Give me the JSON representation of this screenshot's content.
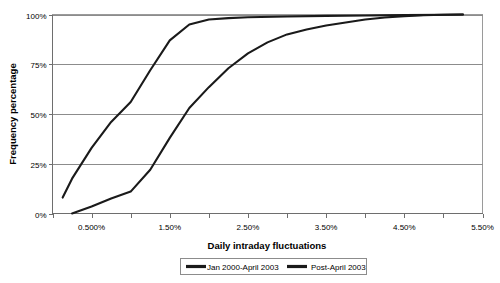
{
  "chart_data": {
    "type": "line",
    "title": "",
    "xlabel": "Daily intraday fluctuations",
    "ylabel": "Frequency percentage",
    "xlim": [
      0.0,
      5.5
    ],
    "ylim": [
      0,
      100
    ],
    "grid": true,
    "legend_position": "bottom",
    "x_tick_labels": [
      "0.500%",
      "1.50%",
      "2.50%",
      "3.50%",
      "4.50%",
      "5.50%"
    ],
    "x_tick_values": [
      0.5,
      1.5,
      2.5,
      3.5,
      4.5,
      5.5
    ],
    "x_minor_tick_values": [
      0.0,
      0.5,
      1.0,
      1.5,
      2.0,
      2.5,
      3.0,
      3.5,
      4.0,
      4.5,
      5.0,
      5.5
    ],
    "y_tick_labels": [
      "0%",
      "25%",
      "50%",
      "75%",
      "100%"
    ],
    "y_tick_values": [
      0,
      25,
      50,
      75,
      100
    ],
    "series": [
      {
        "name": "Jan 2000-April 2003",
        "color": "#1a1a1a",
        "x": [
          0.25,
          0.5,
          0.75,
          1.0,
          1.25,
          1.5,
          1.75,
          2.0,
          2.25,
          2.5,
          2.75,
          3.0,
          3.25,
          3.5,
          3.75,
          4.0,
          4.25,
          4.5,
          4.75,
          5.0,
          5.25
        ],
        "y": [
          0.0,
          3.5,
          7.5,
          11.0,
          22.0,
          38.0,
          53.0,
          63.5,
          73.0,
          80.5,
          86.0,
          90.0,
          92.5,
          94.5,
          96.0,
          97.5,
          98.5,
          99.2,
          99.6,
          99.9,
          100.0
        ]
      },
      {
        "name": "Post-April 2003",
        "color": "#1a1a1a",
        "x": [
          0.13,
          0.25,
          0.5,
          0.75,
          1.0,
          1.25,
          1.5,
          1.75,
          2.0,
          2.25,
          2.5,
          3.0,
          3.5,
          4.0,
          4.5,
          5.0,
          5.25
        ],
        "y": [
          8.0,
          17.5,
          33.0,
          46.0,
          56.0,
          72.0,
          87.0,
          95.0,
          97.5,
          98.2,
          98.6,
          99.0,
          99.3,
          99.5,
          99.7,
          99.9,
          100.0
        ]
      }
    ]
  },
  "legend": {
    "entries": [
      {
        "label": "Jan 2000-April 2003"
      },
      {
        "label": "Post-April 2003"
      }
    ]
  },
  "axis_titles": {
    "x": "Daily intraday fluctuations",
    "y": "Frequency percentage"
  }
}
